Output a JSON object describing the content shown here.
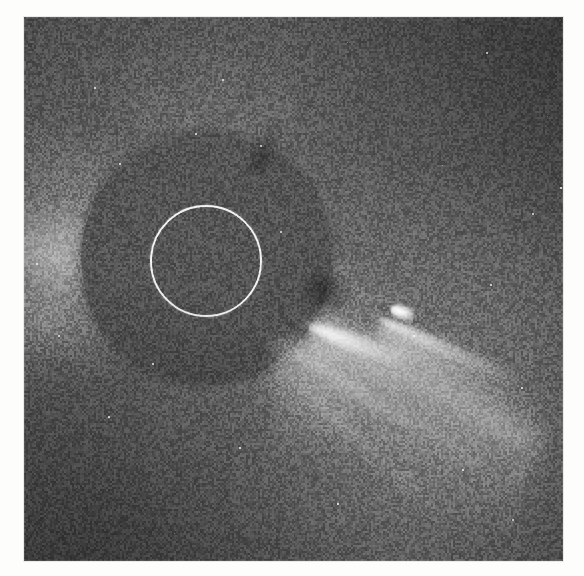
{
  "page": {
    "kind": "photograph",
    "background_color": "#fdfdfb",
    "width": 584,
    "height": 576,
    "alt_text": "Coronagraph image of the solar corona with a bright comet"
  },
  "plate": {
    "left": 24,
    "top": 17,
    "width": 539,
    "height": 544,
    "base_color": "#5a5a5a",
    "description": "Grayscale coronagraph frame showing the occulted Sun, coronal streamers and a comet"
  },
  "occulter": {
    "label": "occulting-disk",
    "center_x": 182,
    "center_y": 241,
    "radius": 125,
    "fill_color": "#585858"
  },
  "sun_circle": {
    "label": "solar-disk-reference-circle",
    "center_x": 182,
    "center_y": 244,
    "radius": 56,
    "stroke_color": "#ffffff",
    "stroke_width": 2
  },
  "comet": {
    "label": "comet",
    "head_x": 379,
    "head_y": 295,
    "tail_angle_deg": 25,
    "tail_length": 210,
    "color": "#ffffff"
  },
  "features": [
    {
      "name": "coronal-ray-north",
      "angle_deg": -86,
      "length": 240,
      "width": 58,
      "brightness": 0.3
    },
    {
      "name": "coronal-ray-north-east",
      "angle_deg": -66,
      "length": 230,
      "width": 46,
      "brightness": 0.34
    },
    {
      "name": "coronal-ray-north-west",
      "angle_deg": -108,
      "length": 235,
      "width": 52,
      "brightness": 0.28
    },
    {
      "name": "coronal-ray-west",
      "angle_deg": -150,
      "length": 215,
      "width": 62,
      "brightness": 0.26
    },
    {
      "name": "coronal-ray-west-low",
      "angle_deg": -172,
      "length": 205,
      "width": 70,
      "brightness": 0.3
    },
    {
      "name": "coronal-ray-south-west",
      "angle_deg": 150,
      "length": 200,
      "width": 60,
      "brightness": 0.2
    },
    {
      "name": "coronal-ray-south",
      "angle_deg": 100,
      "length": 205,
      "width": 58,
      "brightness": 0.18
    },
    {
      "name": "coronal-ray-south-east",
      "angle_deg": 52,
      "length": 250,
      "width": 74,
      "brightness": 0.3
    },
    {
      "name": "cme-fan-south-east",
      "angle_deg": 28,
      "length": 260,
      "width": 110,
      "brightness": 0.4
    },
    {
      "name": "streamer-west-bright",
      "angle_deg": -178,
      "length": 190,
      "width": 86,
      "brightness": 0.34
    }
  ],
  "stars": [
    [
      323,
      25
    ],
    [
      462,
      35
    ],
    [
      198,
      62
    ],
    [
      523,
      99
    ],
    [
      171,
      116
    ],
    [
      95,
      146
    ],
    [
      418,
      148
    ],
    [
      536,
      170
    ],
    [
      508,
      196
    ],
    [
      62,
      223
    ],
    [
      12,
      246
    ],
    [
      466,
      267
    ],
    [
      302,
      298
    ],
    [
      389,
      318
    ],
    [
      128,
      346
    ],
    [
      275,
      356
    ],
    [
      497,
      370
    ],
    [
      84,
      399
    ],
    [
      346,
      406
    ],
    [
      215,
      430
    ],
    [
      438,
      452
    ],
    [
      52,
      470
    ],
    [
      313,
      486
    ],
    [
      488,
      502
    ],
    [
      150,
      516
    ],
    [
      256,
      214
    ],
    [
      34,
      318
    ],
    [
      404,
      222
    ],
    [
      70,
      70
    ],
    [
      236,
      128
    ]
  ],
  "grain": {
    "opacity": 0.4,
    "description": "analog film grain / sensor noise overlay"
  }
}
